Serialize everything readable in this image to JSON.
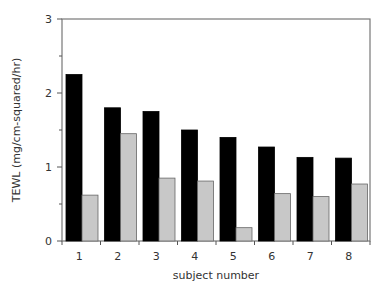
{
  "chart_data": {
    "type": "bar",
    "title": "",
    "xlabel": "subject number",
    "ylabel": "TEWL (mg/cm-squared/hr)",
    "ylim": [
      0,
      3
    ],
    "yticks": [
      0,
      1,
      2,
      3
    ],
    "categories": [
      "1",
      "2",
      "3",
      "4",
      "5",
      "6",
      "7",
      "8"
    ],
    "series": [
      {
        "name": "series-1",
        "color": "#000000",
        "values": [
          2.25,
          1.8,
          1.75,
          1.5,
          1.4,
          1.27,
          1.13,
          1.12
        ]
      },
      {
        "name": "series-2",
        "color": "#c8c8c8",
        "values": [
          0.62,
          1.45,
          0.85,
          0.81,
          0.18,
          0.64,
          0.6,
          0.77
        ]
      }
    ],
    "grid": false,
    "legend": null
  }
}
